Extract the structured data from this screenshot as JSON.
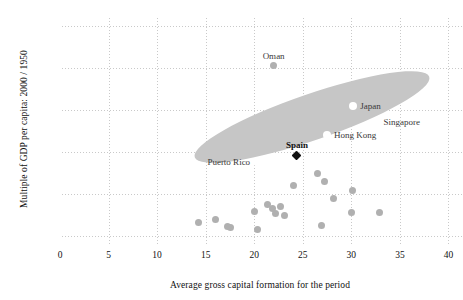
{
  "chart_data": {
    "type": "scatter",
    "title": "",
    "xlabel": "Average gross capital formation for the period",
    "ylabel": "Multiple of GDP per capita: 2000 / 1950",
    "xlim": [
      0,
      41.5
    ],
    "ylim": [
      0.3,
      16.6
    ],
    "xticks": [
      0,
      5,
      10,
      15,
      20,
      25,
      30,
      35,
      40
    ],
    "yticks": [
      1,
      4,
      7,
      10,
      13,
      16
    ],
    "grid": true,
    "legend": "none",
    "annotations": [
      {
        "text": "Oman",
        "x": 22.0,
        "y": 13.2,
        "pos": "above"
      },
      {
        "text": "Japan",
        "x": 30.2,
        "y": 10.3,
        "pos": "right"
      },
      {
        "text": "Singapore",
        "x": 32.6,
        "y": 9.2,
        "pos": "right"
      },
      {
        "text": "Hong Kong",
        "x": 27.5,
        "y": 8.2,
        "pos": "right"
      },
      {
        "text": "Spain",
        "x": 24.4,
        "y": 6.8,
        "pos": "above"
      },
      {
        "text": "Puerto Rico",
        "x": 20.3,
        "y": 6.3,
        "pos": "left"
      }
    ],
    "ellipse": {
      "note": "grey highlight band covering the fast-growth outliers",
      "x_range": [
        18.0,
        34.5
      ],
      "y_range": [
        5.0,
        11.0
      ],
      "color": "#c6c6c6"
    },
    "series": [
      {
        "name": "labelled-outliers",
        "marker": "open-circle",
        "color": "#ffffff",
        "points": [
          {
            "label": "Japan",
            "x": 30.2,
            "y": 10.3
          },
          {
            "label": "Singapore",
            "x": 32.6,
            "y": 9.2
          },
          {
            "label": "Hong Kong",
            "x": 27.5,
            "y": 8.2
          },
          {
            "label": "Puerto Rico",
            "x": 20.3,
            "y": 6.3
          }
        ]
      },
      {
        "name": "spain-highlight",
        "marker": "filled-diamond",
        "color": "#111111",
        "points": [
          {
            "label": "Spain",
            "x": 24.4,
            "y": 6.8
          }
        ]
      },
      {
        "name": "other-countries",
        "marker": "filled-circle",
        "color": "#b0b0b0",
        "points": [
          {
            "label": "Oman",
            "x": 22.0,
            "y": 13.2
          },
          {
            "label": "",
            "x": 26.5,
            "y": 5.5
          },
          {
            "label": "",
            "x": 27.2,
            "y": 4.9
          },
          {
            "label": "",
            "x": 24.0,
            "y": 4.6
          },
          {
            "label": "",
            "x": 28.2,
            "y": 3.7
          },
          {
            "label": "",
            "x": 30.1,
            "y": 4.3
          },
          {
            "label": "",
            "x": 30.0,
            "y": 2.7
          },
          {
            "label": "",
            "x": 32.9,
            "y": 2.7
          },
          {
            "label": "",
            "x": 21.4,
            "y": 3.3
          },
          {
            "label": "",
            "x": 21.9,
            "y": 3.0
          },
          {
            "label": "",
            "x": 22.7,
            "y": 3.1
          },
          {
            "label": "",
            "x": 22.2,
            "y": 2.6
          },
          {
            "label": "",
            "x": 23.1,
            "y": 2.5
          },
          {
            "label": "",
            "x": 20.0,
            "y": 2.8
          },
          {
            "label": "",
            "x": 14.3,
            "y": 2.0
          },
          {
            "label": "",
            "x": 16.0,
            "y": 2.2
          },
          {
            "label": "",
            "x": 17.3,
            "y": 1.7
          },
          {
            "label": "",
            "x": 17.6,
            "y": 1.6
          },
          {
            "label": "",
            "x": 20.3,
            "y": 1.5
          },
          {
            "label": "",
            "x": 26.9,
            "y": 1.8
          }
        ]
      }
    ]
  }
}
